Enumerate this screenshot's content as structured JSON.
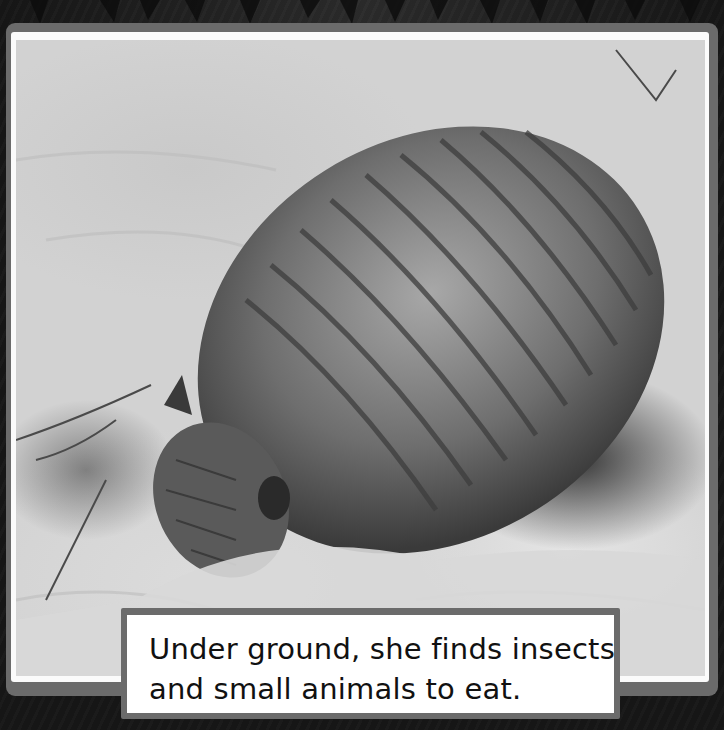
{
  "page": {
    "caption": {
      "lines": [
        "Under ground, she finds insects",
        "and small animals to eat."
      ]
    },
    "photo": {
      "subject": "armadillo digging in sand",
      "style": "black-and-white photograph"
    },
    "colors": {
      "background": "#1c1c1c",
      "frame": "#6b6b6b",
      "mat": "#fbfbfb",
      "caption_bg": "#ffffff",
      "caption_text": "#111111"
    }
  }
}
